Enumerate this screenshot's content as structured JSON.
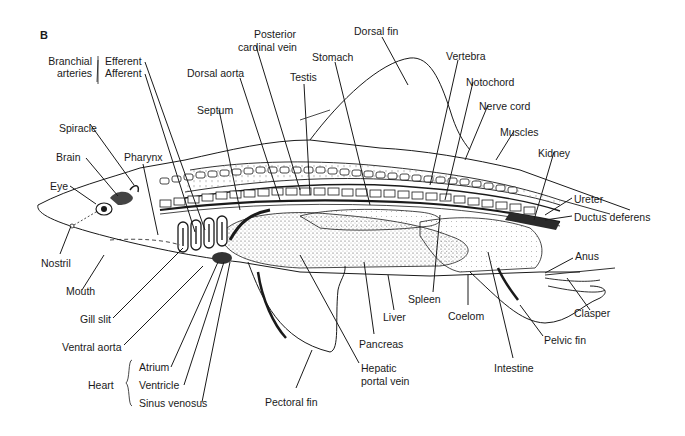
{
  "figure": {
    "panel_label": "B"
  },
  "labels": {
    "branchial_arteries": "Branchial arteries",
    "branchial_arteries_l1": "Branchial",
    "branchial_arteries_l2": "arteries",
    "efferent": "Efferent",
    "afferent": "Afferent",
    "posterior_cardinal_vein_l1": "Posterior",
    "posterior_cardinal_vein_l2": "cardinal vein",
    "dorsal_aorta": "Dorsal aorta",
    "septum": "Septum",
    "testis": "Testis",
    "stomach": "Stomach",
    "dorsal_fin": "Dorsal fin",
    "vertebra": "Vertebra",
    "notochord": "Notochord",
    "nerve_cord": "Nerve cord",
    "muscles": "Muscles",
    "kidney": "Kidney",
    "ureter": "Ureter",
    "ductus_deferens": "Ductus deferens",
    "spiracle": "Spiracle",
    "brain": "Brain",
    "pharynx": "Pharynx",
    "eye": "Eye",
    "nostril": "Nostril",
    "mouth": "Mouth",
    "gill_slit": "Gill slit",
    "ventral_aorta": "Ventral aorta",
    "heart": "Heart",
    "atrium": "Atrium",
    "ventricle": "Ventricle",
    "sinus_venosus": "Sinus venosus",
    "pectoral_fin": "Pectoral fin",
    "hepatic_portal_vein_l1": "Hepatic",
    "hepatic_portal_vein_l2": "portal vein",
    "pancreas": "Pancreas",
    "liver": "Liver",
    "spleen": "Spleen",
    "coelom": "Coelom",
    "intestine": "Intestine",
    "pelvic_fin": "Pelvic fin",
    "clasper": "Clasper",
    "anus": "Anus"
  },
  "groups": {
    "branchial_arteries": [
      "Efferent",
      "Afferent"
    ],
    "heart": [
      "Atrium",
      "Ventricle",
      "Sinus venosus"
    ]
  },
  "colors": {
    "ink": "#1a1a1a",
    "background": "#ffffff",
    "stipple": "#555555"
  }
}
